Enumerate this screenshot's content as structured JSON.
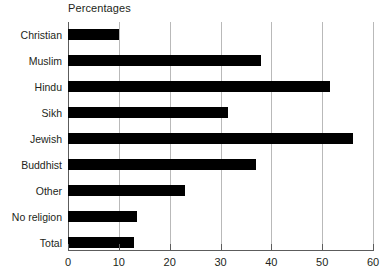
{
  "chart_data": {
    "type": "bar",
    "orientation": "horizontal",
    "title": "Percentages",
    "xlabel": "",
    "ylabel": "",
    "xlim": [
      0,
      60
    ],
    "xticks": [
      0,
      10,
      20,
      30,
      40,
      50,
      60
    ],
    "xtick_labels": [
      "0",
      "10",
      "20",
      "30",
      "40",
      "50",
      "60"
    ],
    "grid": true,
    "grid_axis": "x",
    "legend": false,
    "bar_color": "#000000",
    "categories": [
      "Christian",
      "Muslim",
      "Hindu",
      "Sikh",
      "Jewish",
      "Buddhist",
      "Other",
      "No religion",
      "Total"
    ],
    "values": [
      10,
      38,
      51.5,
      31.5,
      56,
      37,
      23,
      13.5,
      13
    ]
  }
}
